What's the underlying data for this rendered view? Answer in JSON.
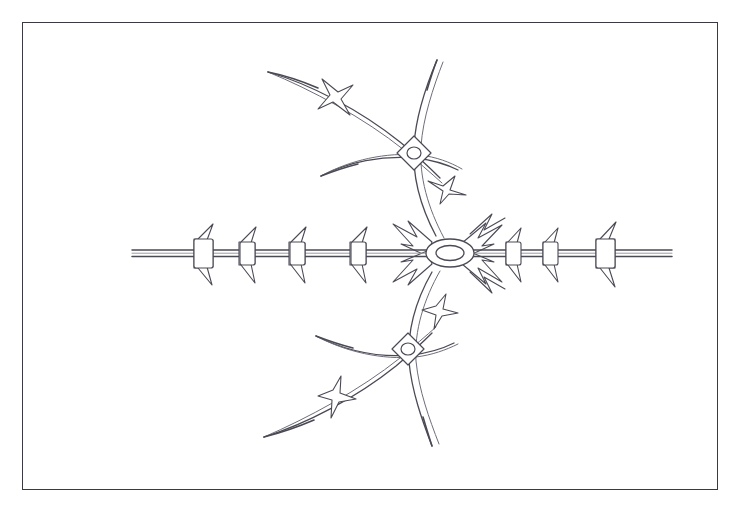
{
  "page": {
    "width": 745,
    "height": 507,
    "background_color": "#ffffff",
    "header_faint_text": "",
    "document_type": "technical-line-drawing"
  },
  "frame": {
    "name": "figure-border",
    "x": 22,
    "y": 22,
    "width": 696,
    "height": 468,
    "stroke_color": "#3a3a42",
    "stroke_width": 1.6,
    "fill_color": "#ffffff"
  },
  "drawing": {
    "title": "Barbed wire assembly",
    "line_color": "#4a4a55",
    "line_color_light": "#6e6e7a",
    "fill_color": "#ffffff",
    "stroke_width": 1.2,
    "hub": {
      "name": "central-hub-ring",
      "cx": 450,
      "cy": 253,
      "outer_rx": 24,
      "outer_ry": 14,
      "inner_rx": 14,
      "inner_ry": 7.5
    },
    "horizontal_wire": {
      "name": "main-horizontal-strand",
      "y_center": 253,
      "x_start": 132,
      "x_end": 672,
      "strand_offset": 3.2
    },
    "left_barbs": [
      {
        "x": 203,
        "size": "large"
      },
      {
        "x": 247,
        "size": "medium"
      },
      {
        "x": 297,
        "size": "medium"
      },
      {
        "x": 358,
        "size": "medium"
      }
    ],
    "right_barbs": [
      {
        "x": 513,
        "size": "medium"
      },
      {
        "x": 550,
        "size": "medium"
      },
      {
        "x": 605,
        "size": "large"
      }
    ],
    "hub_radial_barbs": [
      {
        "angle_deg": -45,
        "label": "upper-right"
      },
      {
        "angle_deg": -135,
        "label": "upper-left"
      },
      {
        "angle_deg": 45,
        "label": "lower-right"
      },
      {
        "angle_deg": 135,
        "label": "lower-left"
      }
    ],
    "collars": [
      {
        "name": "upper-collar",
        "cx": 414,
        "cy": 153,
        "half": 17,
        "hole_rx": 7,
        "hole_ry": 6
      },
      {
        "name": "lower-collar",
        "cx": 408,
        "cy": 349,
        "half": 16,
        "hole_rx": 7,
        "hole_ry": 6
      }
    ],
    "branches": [
      {
        "name": "upper-stem",
        "direction": "up"
      },
      {
        "name": "upper-arc",
        "direction": "up-left"
      },
      {
        "name": "lower-stem",
        "direction": "down"
      },
      {
        "name": "lower-arc",
        "direction": "down-left"
      }
    ],
    "branch_barbs": [
      {
        "name": "upper-arc-barb",
        "cx": 337,
        "cy": 96
      },
      {
        "name": "upper-stem-barb",
        "cx": 446,
        "cy": 187
      },
      {
        "name": "lower-arc-barb",
        "cx": 332,
        "cy": 404
      },
      {
        "name": "lower-stem-barb",
        "cx": 437,
        "cy": 315
      }
    ]
  }
}
